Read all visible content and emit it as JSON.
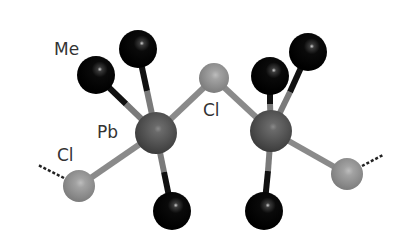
{
  "diagram": {
    "type": "molecular-structure",
    "labels": {
      "me": "Me",
      "pb": "Pb",
      "cl_bridge": "Cl",
      "cl_left": "Cl"
    },
    "colors": {
      "pb": "#5a5a5a",
      "cl": "#9a9a9a",
      "me": "#0a0a0a",
      "bond_light": "#8a8a8a",
      "bond_dark": "#1a1a1a",
      "label": "#333333"
    },
    "atoms": [
      {
        "id": "pb1",
        "element": "Pb",
        "x": 156,
        "y": 133,
        "r": 21
      },
      {
        "id": "pb2",
        "element": "Pb",
        "x": 271,
        "y": 131,
        "r": 21
      },
      {
        "id": "cl_bridge",
        "element": "Cl",
        "x": 214,
        "y": 78,
        "r": 15
      },
      {
        "id": "cl_left",
        "element": "Cl",
        "x": 79,
        "y": 186,
        "r": 16
      },
      {
        "id": "cl_right",
        "element": "Cl",
        "x": 347,
        "y": 174,
        "r": 16
      },
      {
        "id": "me1",
        "element": "C",
        "x": 96,
        "y": 75,
        "r": 19
      },
      {
        "id": "me2",
        "element": "C",
        "x": 138,
        "y": 49,
        "r": 19
      },
      {
        "id": "me3",
        "element": "C",
        "x": 172,
        "y": 211,
        "r": 19
      },
      {
        "id": "me4",
        "element": "C",
        "x": 270,
        "y": 76,
        "r": 19
      },
      {
        "id": "me5",
        "element": "C",
        "x": 308,
        "y": 52,
        "r": 19
      },
      {
        "id": "me6",
        "element": "C",
        "x": 264,
        "y": 211,
        "r": 19
      }
    ]
  }
}
